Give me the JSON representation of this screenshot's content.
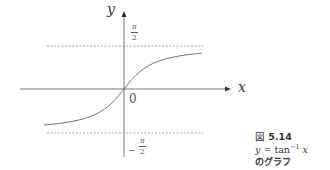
{
  "figure": {
    "number_prefix": "図",
    "number": "5.14",
    "equation_lhs": "y",
    "equation_eq": " = ",
    "equation_func": "tan",
    "equation_exp": "−1",
    "equation_arg": "x",
    "subtitle": "のグラフ"
  },
  "axes": {
    "x_label": "x",
    "y_label": "y",
    "origin_label": "0",
    "upper_asymptote": {
      "num": "π",
      "den": "2",
      "sign": ""
    },
    "lower_asymptote": {
      "num": "π",
      "den": "2",
      "sign": "−"
    }
  },
  "colors": {
    "axis": "#555555",
    "curve": "#666666",
    "dashed": "#777777",
    "text": "#333333"
  },
  "chart_data": {
    "type": "line",
    "xlabel": "x",
    "ylabel": "y",
    "function": "y = arctan(x)",
    "asymptotes": [
      1.5708,
      -1.5708
    ],
    "asymptote_labels": [
      "π/2",
      "−π/2"
    ],
    "origin_label": "0",
    "x": [
      -5,
      -4,
      -3,
      -2,
      -1,
      0,
      1,
      2,
      3,
      4,
      5
    ],
    "series": [
      {
        "name": "tan^-1 x",
        "values": [
          -1.373,
          -1.326,
          -1.249,
          -1.107,
          -0.785,
          0,
          0.785,
          1.107,
          1.249,
          1.326,
          1.373
        ]
      }
    ],
    "grid": false,
    "legend": "none"
  }
}
